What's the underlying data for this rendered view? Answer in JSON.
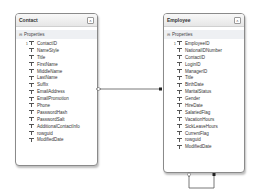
{
  "diagram": {
    "entities": [
      {
        "name": "Contact",
        "section": "Properties",
        "key": "ContactID",
        "properties": [
          "ContactID",
          "NameStyle",
          "Title",
          "FirstName",
          "MiddleName",
          "LastName",
          "Suffix",
          "EmailAddress",
          "EmailPromotion",
          "Phone",
          "PasswordHash",
          "PasswordSalt",
          "AdditionalContactInfo",
          "rowguid",
          "ModifiedDate"
        ]
      },
      {
        "name": "Employee",
        "section": "Properties",
        "key": "EmployeeID",
        "properties": [
          "EmployeeID",
          "NationalIDNumber",
          "ContactID",
          "LoginID",
          "ManagerID",
          "Title",
          "BirthDate",
          "MaritalStatus",
          "Gender",
          "HireDate",
          "SalariedFlag",
          "VacationHours",
          "SickLeaveHours",
          "CurrentFlag",
          "rowguid",
          "ModifiedDate"
        ]
      }
    ],
    "collapse_glyph": "˄",
    "section_toggle_glyph": "⊟",
    "key_marker": "1",
    "associations": [
      {
        "from": "Contact",
        "to": "Employee",
        "from_end": "1",
        "to_end": "*"
      },
      {
        "from": "Employee",
        "to": "Employee",
        "self_reference": true
      }
    ],
    "colors": {
      "border": "#8a8a8a",
      "header_bg": "#e6e6e6",
      "line": "#555555"
    }
  }
}
